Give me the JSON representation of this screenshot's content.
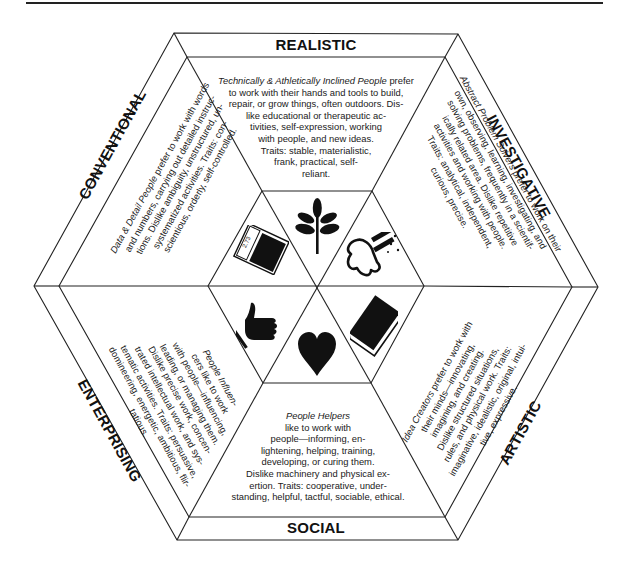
{
  "colors": {
    "ink": "#1a1a1a",
    "background": "#ffffff"
  },
  "sectors": {
    "realistic": {
      "label": "REALISTIC",
      "lead": "Technically & Athletically Inclined People",
      "lines_rest": [
        "prefer",
        "to work with their hands and tools to build,",
        "repair, or grow things, often outdoors. Dis-",
        "like educational or therapeutic ac-",
        "tivities, self-expression, working",
        "with people, and new ideas.",
        "Traits: stable, materialistic,",
        "frank, practical, self-",
        "reliant."
      ],
      "icon": "plant-icon"
    },
    "investigative": {
      "label": "INVESTIGATIVE",
      "lead": "Abstract Problem Solvers",
      "lines_rest": [
        "prefer to work on their",
        "own, observing, learning, investigating, and",
        "solving problems, frequently in a scientif-",
        "ically related area. Dislike repetitive",
        "activities and working with people.",
        "Traits: analytical, independent,",
        "curious, precise."
      ],
      "icon": "flasks-icon"
    },
    "artistic": {
      "label": "ARTISTIC",
      "lead": "Idea Creators",
      "lines_rest": [
        "prefer to work with",
        "their minds—innovating,",
        "imagining, and creating.",
        "Dislike structured situations,",
        "rules, and physical work. Traits:",
        "imaginative, idealistic, original, intui-",
        "tive, expressive."
      ],
      "icon": "book-icon"
    },
    "social": {
      "label": "SOCIAL",
      "lead": "People Helpers",
      "lines_rest": [
        "like to work with",
        "people—informing, en-",
        "lightening, helping, training,",
        "developing, or curing them.",
        "Dislike machinery and physical ex-",
        "ertion. Traits: cooperative, under-",
        "standing, helpful, tactful, sociable, ethical."
      ],
      "icon": "heart-icon"
    },
    "enterprising": {
      "label": "ENTERPRISING",
      "lead": "People Influen-",
      "lines_rest": [
        "cers like to work",
        "with people—influencing,",
        "leading, or managing them.",
        "Dislike precise work, concen-",
        "trated intellectual work, and sys-",
        "tematic activities. Traits: persuasive,",
        "domineering, energetic, ambitious, flir-",
        "tatious."
      ],
      "icon": "thumbs-up-icon"
    },
    "conventional": {
      "label": "CONVENTIONAL",
      "lead": "Data & Detail People",
      "lines_rest": [
        "prefer to work with words",
        "and numbers, carrying out detailed instruc-",
        "tions. Dislike ambiguity, unstructured, un-",
        "systematized activities. Traits: con-",
        "scientious, orderly, self-controlled."
      ],
      "icon": "calculator-icon",
      "calculator_display": "2.73"
    }
  }
}
